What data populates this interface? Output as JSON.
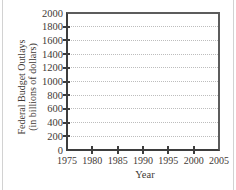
{
  "page": {
    "background": "#ffffff"
  },
  "frame": {
    "left_edge_color": "#d2d2d2",
    "right_edge_color": "#d2d2d2"
  },
  "chart_data": {
    "type": "line",
    "title": "",
    "xlabel": "Year",
    "ylabel": "Federal Budget Outlays (in billions of dollars)",
    "ylabel_line1": "Federal Budget Outlays",
    "ylabel_line2": "(in billions of dollars)",
    "xlim": [
      1975,
      2005
    ],
    "ylim": [
      0,
      2000
    ],
    "x_ticks": [
      1975,
      1980,
      1985,
      1990,
      1995,
      2000,
      2005
    ],
    "y_ticks": [
      0,
      200,
      400,
      600,
      800,
      1000,
      1200,
      1400,
      1600,
      1800,
      2000
    ],
    "grid": "horizontal-dotted",
    "legend": "none",
    "series": [],
    "colors": {
      "axis": "#3d3d3d",
      "frame": "#5c5c5c",
      "grid": "#bdbdbd",
      "text": "#3f3a36"
    }
  }
}
